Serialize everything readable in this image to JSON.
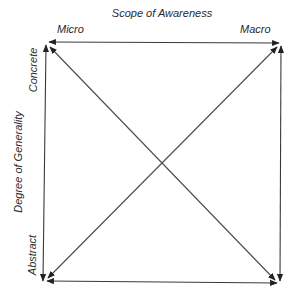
{
  "diagram": {
    "title_top": "Scope of Awareness",
    "title_left": "Degree of Generality",
    "corners": {
      "top_left": "Micro",
      "top_right": "Macro",
      "left_top": "Concrete",
      "left_bottom": "Abstract"
    },
    "arrows": [
      {
        "name": "micro-macro-arrow",
        "from": "top-left",
        "to": "top-right",
        "heads": "both"
      },
      {
        "name": "concrete-abstract-arrow",
        "from": "top-left",
        "to": "bottom-left",
        "heads": "both"
      },
      {
        "name": "top-right-bottom-right-arrow",
        "from": "top-right",
        "to": "bottom-right",
        "heads": "both"
      },
      {
        "name": "bottom-left-bottom-right-arrow",
        "from": "bottom-left",
        "to": "bottom-right",
        "heads": "both"
      },
      {
        "name": "diagonal-tl-br-arrow",
        "from": "top-left",
        "to": "bottom-right",
        "heads": "both"
      },
      {
        "name": "diagonal-bl-tr-arrow",
        "from": "bottom-left",
        "to": "top-right",
        "heads": "both"
      }
    ],
    "colors": {
      "line": "#3a3a3a",
      "text": "#2a2a2a",
      "background": "#ffffff"
    }
  }
}
